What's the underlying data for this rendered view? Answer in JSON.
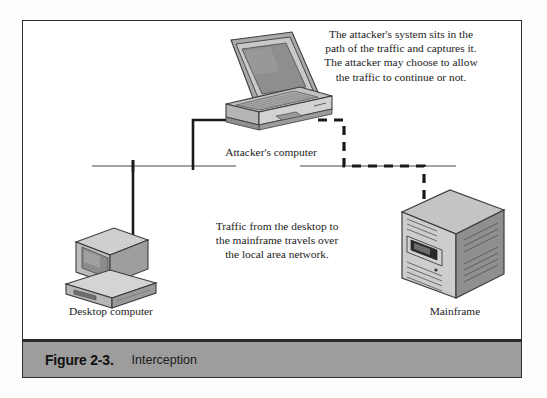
{
  "figure": {
    "caption_number": "Figure 2-3.",
    "caption_title": "Interception"
  },
  "annotations": {
    "attacker_note": "The attacker's system sits in the\npath of the traffic and captures it.\nThe attacker may choose to allow\nthe traffic to continue or not.",
    "traffic_note": "Traffic from the desktop to\nthe mainframe travels over\nthe local area network."
  },
  "devices": {
    "attacker_label": "Attacker's computer",
    "desktop_label": "Desktop computer",
    "mainframe_label": "Mainframe"
  },
  "colors": {
    "frame_border": "#2f2f2f",
    "caption_bar": "#9d9d9d",
    "caption_bar_edge": "#2b2b2b",
    "wire_solid": "#1a1a1a",
    "wire_bus": "#4a4a4a",
    "wire_dashed": "#1a1a1a",
    "device_light": "#d8d8d8",
    "device_mid": "#b0b0b0",
    "device_dark": "#7d7d7d",
    "device_outline": "#3c3c3c",
    "page_background": "#ffffff"
  }
}
